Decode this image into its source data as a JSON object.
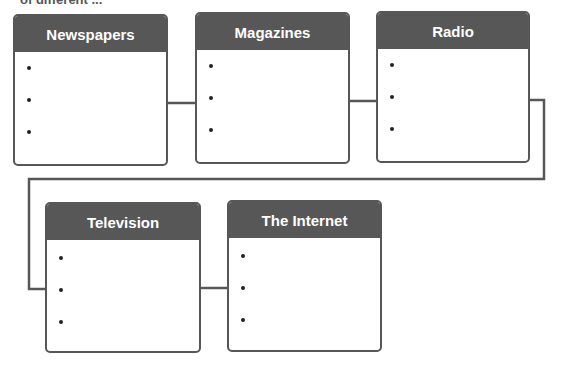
{
  "top_text": "of different ...",
  "colors": {
    "header": "#575757",
    "connector": "#575757",
    "header_text": "#ffffff"
  },
  "boxes": [
    {
      "title": "Newspapers",
      "bullets": [
        "",
        "",
        ""
      ]
    },
    {
      "title": "Magazines",
      "bullets": [
        "",
        "",
        ""
      ]
    },
    {
      "title": "Radio",
      "bullets": [
        "",
        "",
        ""
      ]
    },
    {
      "title": "Television",
      "bullets": [
        "",
        "",
        ""
      ]
    },
    {
      "title": "The Internet",
      "bullets": [
        "",
        "",
        ""
      ]
    }
  ]
}
